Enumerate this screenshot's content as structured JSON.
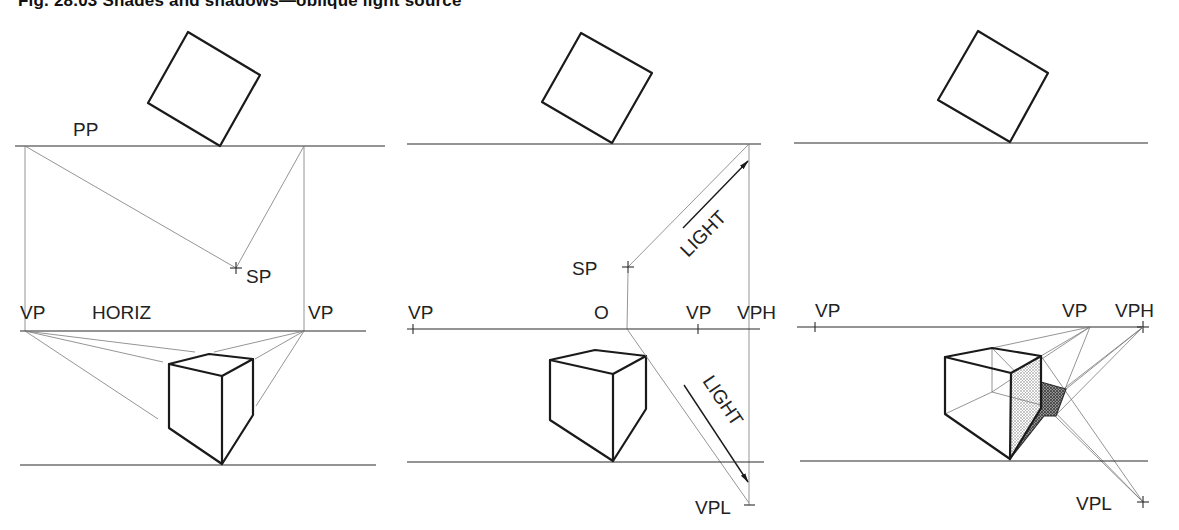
{
  "figure": {
    "title": "Fig. 28.03 Shades and shadows—oblique light source"
  },
  "panels": [
    {
      "id": "panel-1",
      "labels": {
        "picture_plane": "PP",
        "station_point": "SP",
        "vp_left": "VP",
        "horizon": "HORIZ",
        "vp_right": "VP"
      }
    },
    {
      "id": "panel-2",
      "labels": {
        "station_point": "SP",
        "light_upper": "LIGHT",
        "vp_left": "VP",
        "origin": "O",
        "vp_right": "VP",
        "vp_high": "VPH",
        "light_lower": "LIGHT",
        "vp_light": "VPL"
      }
    },
    {
      "id": "panel-3",
      "labels": {
        "vp_left": "VP",
        "vp_right": "VP",
        "vp_high": "VPH",
        "vp_light": "VPL"
      }
    }
  ],
  "colors": {
    "ink": "#1a1a1a",
    "construction": "#7a7a7a",
    "shade_light": "#c8c8c8",
    "shadow_dark": "#6a6a6a"
  }
}
